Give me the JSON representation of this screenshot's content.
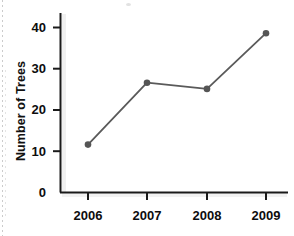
{
  "chart_data": {
    "type": "line",
    "title": "",
    "xlabel": "",
    "ylabel": "Number of Trees",
    "categories": [
      "2006",
      "2007",
      "2008",
      "2009"
    ],
    "values": [
      11.5,
      26.5,
      25,
      38.5
    ],
    "series": [
      {
        "name": "Number of Trees",
        "values": [
          11.5,
          26.5,
          25,
          38.5
        ]
      }
    ],
    "y_ticks": [
      0,
      10,
      20,
      30,
      40
    ],
    "y_tick_labels": [
      "0",
      "10",
      "20",
      "30",
      "40"
    ],
    "ylim": [
      0,
      43
    ],
    "xlim": [
      2005.4,
      2009.6
    ],
    "grid": false,
    "legend": false,
    "legend_position": "none",
    "marker": "circle",
    "line_color": "#5a5a5a",
    "marker_color": "#555555",
    "axis_color": "#1a1a1a",
    "text_color": "#0d0d0d",
    "background_color": "#ffffff"
  },
  "axes": {
    "y_label": "Number of Trees",
    "y_tick_labels": [
      "40",
      "30",
      "20",
      "10",
      "0"
    ],
    "x_tick_labels": [
      "2006",
      "2007",
      "2008",
      "2009"
    ]
  }
}
